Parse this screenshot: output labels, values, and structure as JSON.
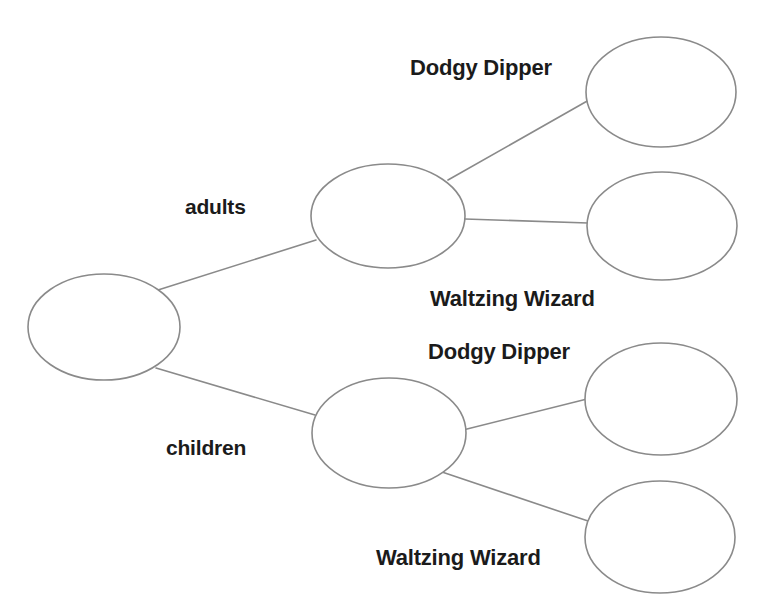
{
  "diagram": {
    "type": "tree",
    "background_color": "#ffffff",
    "stroke_color": "#8a8a8a",
    "text_color": "#1b1b1b",
    "cut_off_top_text": "",
    "nodes": [
      {
        "id": "root",
        "label": "",
        "cx": 104,
        "cy": 327,
        "rx": 76,
        "ry": 53,
        "level": 0
      },
      {
        "id": "adults",
        "label": "",
        "cx": 388,
        "cy": 216,
        "rx": 77,
        "ry": 52,
        "level": 1
      },
      {
        "id": "children",
        "label": "",
        "cx": 389,
        "cy": 433,
        "rx": 77,
        "ry": 55,
        "level": 1
      },
      {
        "id": "adults-dodgy",
        "label": "",
        "cx": 661,
        "cy": 92,
        "rx": 75,
        "ry": 55,
        "level": 2
      },
      {
        "id": "adults-waltz",
        "label": "",
        "cx": 662,
        "cy": 226,
        "rx": 75,
        "ry": 54,
        "level": 2
      },
      {
        "id": "children-dodgy",
        "label": "",
        "cx": 661,
        "cy": 399,
        "rx": 76,
        "ry": 56,
        "level": 2
      },
      {
        "id": "children-waltz",
        "label": "",
        "cx": 660,
        "cy": 537,
        "rx": 75,
        "ry": 56,
        "level": 2
      }
    ],
    "edges": [
      {
        "id": "root-adults",
        "from": "root",
        "to": "adults",
        "label": "adults",
        "x1": 158,
        "y1": 290,
        "x2": 316,
        "y2": 240
      },
      {
        "id": "root-children",
        "from": "root",
        "to": "children",
        "label": "children",
        "x1": 156,
        "y1": 368,
        "x2": 315,
        "y2": 415
      },
      {
        "id": "adults-dodgy-edge",
        "from": "adults",
        "to": "adults-dodgy",
        "label": "Dodgy Dipper",
        "x1": 448,
        "y1": 180,
        "x2": 589,
        "y2": 100
      },
      {
        "id": "adults-waltz-edge",
        "from": "adults",
        "to": "adults-waltz",
        "label": "Waltzing Wizard",
        "x1": 465,
        "y1": 219,
        "x2": 588,
        "y2": 223
      },
      {
        "id": "children-dodgy-edge",
        "from": "children",
        "to": "children-dodgy",
        "label": "Dodgy Dipper",
        "x1": 463,
        "y1": 430,
        "x2": 587,
        "y2": 399
      },
      {
        "id": "children-waltz-edge",
        "from": "children",
        "to": "children-waltz",
        "label": "Waltzing Wizard",
        "x1": 442,
        "y1": 472,
        "x2": 591,
        "y2": 522
      }
    ],
    "labels": {
      "adults": "adults",
      "children": "children",
      "dodgy_dipper_top": "Dodgy Dipper",
      "waltzing_wizard_top": "Waltzing Wizard",
      "dodgy_dipper_bottom": "Dodgy Dipper",
      "waltzing_wizard_bottom": "Waltzing Wizard"
    }
  }
}
